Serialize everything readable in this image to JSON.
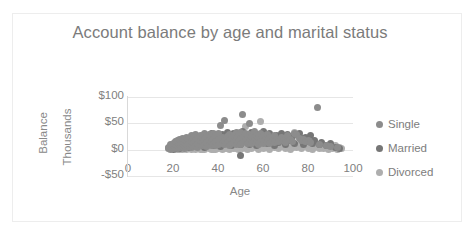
{
  "chart_data": {
    "type": "scatter",
    "title": "Account balance by age and marital status",
    "xlabel": "Age",
    "ylabel": "Balance",
    "y_unit_label": "Thousands",
    "xlim": [
      0,
      100
    ],
    "ylim": [
      -50,
      100
    ],
    "x_ticks": [
      "0",
      "20",
      "40",
      "60",
      "80",
      "100"
    ],
    "x_tick_values": [
      0,
      20,
      40,
      60,
      80,
      100
    ],
    "y_ticks": [
      "$100",
      "$50",
      "$0",
      "-$50"
    ],
    "y_tick_values": [
      100,
      50,
      0,
      -50
    ],
    "grid": true,
    "grid_axis": "y",
    "legend_position": "right",
    "marker_size_px": 7,
    "series": [
      {
        "name": "Single",
        "color": "#8c8c8c",
        "points": [
          [
            18,
            2
          ],
          [
            18,
            4
          ],
          [
            19,
            1
          ],
          [
            19,
            6
          ],
          [
            19,
            9
          ],
          [
            20,
            3
          ],
          [
            20,
            8
          ],
          [
            20,
            12
          ],
          [
            21,
            5
          ],
          [
            21,
            10
          ],
          [
            21,
            15
          ],
          [
            22,
            2
          ],
          [
            22,
            7
          ],
          [
            22,
            13
          ],
          [
            22,
            18
          ],
          [
            23,
            4
          ],
          [
            23,
            9
          ],
          [
            23,
            14
          ],
          [
            23,
            20
          ],
          [
            24,
            6
          ],
          [
            24,
            11
          ],
          [
            24,
            16
          ],
          [
            24,
            22
          ],
          [
            25,
            3
          ],
          [
            25,
            8
          ],
          [
            25,
            13
          ],
          [
            25,
            19
          ],
          [
            26,
            5
          ],
          [
            26,
            10
          ],
          [
            26,
            17
          ],
          [
            26,
            24
          ],
          [
            27,
            7
          ],
          [
            27,
            12
          ],
          [
            27,
            21
          ],
          [
            28,
            4
          ],
          [
            28,
            9
          ],
          [
            28,
            16
          ],
          [
            28,
            27
          ],
          [
            29,
            6
          ],
          [
            29,
            14
          ],
          [
            29,
            23
          ],
          [
            30,
            8
          ],
          [
            30,
            18
          ],
          [
            30,
            28
          ],
          [
            31,
            5
          ],
          [
            31,
            12
          ],
          [
            31,
            22
          ],
          [
            32,
            9
          ],
          [
            32,
            17
          ],
          [
            32,
            26
          ],
          [
            33,
            7
          ],
          [
            33,
            15
          ],
          [
            33,
            24
          ],
          [
            34,
            10
          ],
          [
            34,
            20
          ],
          [
            34,
            30
          ],
          [
            35,
            6
          ],
          [
            35,
            14
          ],
          [
            35,
            25
          ],
          [
            36,
            9
          ],
          [
            36,
            19
          ],
          [
            36,
            28
          ],
          [
            37,
            8
          ],
          [
            37,
            16
          ],
          [
            37,
            27
          ],
          [
            38,
            11
          ],
          [
            38,
            21
          ],
          [
            38,
            31
          ],
          [
            39,
            7
          ],
          [
            39,
            15
          ],
          [
            39,
            26
          ],
          [
            40,
            10
          ],
          [
            40,
            20
          ],
          [
            40,
            30
          ],
          [
            41,
            45
          ],
          [
            42,
            12
          ],
          [
            42,
            23
          ],
          [
            43,
            56
          ],
          [
            43,
            9
          ],
          [
            43,
            18
          ],
          [
            44,
            14
          ],
          [
            44,
            25
          ],
          [
            45,
            8
          ],
          [
            45,
            17
          ],
          [
            45,
            29
          ],
          [
            46,
            11
          ],
          [
            46,
            22
          ],
          [
            47,
            13
          ],
          [
            47,
            26
          ],
          [
            48,
            9
          ],
          [
            48,
            19
          ],
          [
            48,
            32
          ],
          [
            49,
            15
          ],
          [
            49,
            27
          ],
          [
            50,
            10
          ],
          [
            50,
            21
          ],
          [
            50,
            33
          ],
          [
            51,
            66
          ],
          [
            51,
            13
          ],
          [
            51,
            24
          ],
          [
            52,
            17
          ],
          [
            52,
            30
          ],
          [
            53,
            11
          ],
          [
            53,
            22
          ],
          [
            54,
            50
          ],
          [
            54,
            15
          ],
          [
            54,
            28
          ],
          [
            55,
            12
          ],
          [
            55,
            25
          ],
          [
            56,
            18
          ],
          [
            56,
            34
          ],
          [
            57,
            14
          ],
          [
            57,
            27
          ],
          [
            58,
            10
          ],
          [
            58,
            23
          ],
          [
            59,
            16
          ],
          [
            59,
            30
          ],
          [
            60,
            12
          ],
          [
            60,
            26
          ],
          [
            61,
            19
          ],
          [
            62,
            15
          ],
          [
            62,
            28
          ],
          [
            63,
            11
          ],
          [
            63,
            24
          ],
          [
            64,
            17
          ],
          [
            65,
            13
          ],
          [
            65,
            27
          ],
          [
            66,
            20
          ],
          [
            67,
            15
          ],
          [
            68,
            23
          ],
          [
            69,
            18
          ],
          [
            70,
            14
          ],
          [
            71,
            26
          ],
          [
            72,
            19
          ],
          [
            73,
            16
          ],
          [
            74,
            31
          ],
          [
            75,
            29
          ],
          [
            76,
            22
          ],
          [
            77,
            17
          ],
          [
            78,
            20
          ],
          [
            79,
            15
          ],
          [
            80,
            18
          ],
          [
            81,
            13
          ],
          [
            84,
            81
          ],
          [
            85,
            10
          ],
          [
            88,
            8
          ],
          [
            90,
            6
          ],
          [
            93,
            4
          ]
        ]
      },
      {
        "name": "Married",
        "color": "#767676",
        "points": [
          [
            20,
            1
          ],
          [
            21,
            3
          ],
          [
            22,
            5
          ],
          [
            23,
            2
          ],
          [
            24,
            8
          ],
          [
            25,
            6
          ],
          [
            26,
            12
          ],
          [
            27,
            4
          ],
          [
            28,
            14
          ],
          [
            29,
            9
          ],
          [
            30,
            19
          ],
          [
            31,
            7
          ],
          [
            32,
            21
          ],
          [
            33,
            13
          ],
          [
            34,
            5
          ],
          [
            35,
            23
          ],
          [
            36,
            11
          ],
          [
            37,
            30
          ],
          [
            38,
            8
          ],
          [
            39,
            24
          ],
          [
            40,
            16
          ],
          [
            41,
            6
          ],
          [
            42,
            29
          ],
          [
            43,
            12
          ],
          [
            44,
            33
          ],
          [
            45,
            20
          ],
          [
            46,
            7
          ],
          [
            47,
            31
          ],
          [
            48,
            14
          ],
          [
            49,
            25
          ],
          [
            50,
            9
          ],
          [
            50,
            -12
          ],
          [
            51,
            35
          ],
          [
            52,
            18
          ],
          [
            53,
            27
          ],
          [
            54,
            10
          ],
          [
            55,
            32
          ],
          [
            56,
            21
          ],
          [
            57,
            8
          ],
          [
            58,
            29
          ],
          [
            59,
            16
          ],
          [
            60,
            34
          ],
          [
            61,
            23
          ],
          [
            62,
            11
          ],
          [
            63,
            30
          ],
          [
            64,
            19
          ],
          [
            65,
            7
          ],
          [
            66,
            26
          ],
          [
            67,
            14
          ],
          [
            68,
            31
          ],
          [
            69,
            20
          ],
          [
            70,
            9
          ],
          [
            71,
            28
          ],
          [
            72,
            17
          ],
          [
            73,
            25
          ],
          [
            74,
            12
          ],
          [
            75,
            29
          ],
          [
            76,
            30
          ],
          [
            77,
            21
          ],
          [
            78,
            10
          ],
          [
            79,
            23
          ],
          [
            80,
            15
          ],
          [
            81,
            26
          ],
          [
            82,
            12
          ],
          [
            83,
            18
          ],
          [
            85,
            9
          ],
          [
            86,
            14
          ],
          [
            88,
            7
          ],
          [
            90,
            11
          ],
          [
            92,
            5
          ],
          [
            94,
            3
          ]
        ]
      },
      {
        "name": "Divorced",
        "color": "#aeaeae",
        "points": [
          [
            22,
            0
          ],
          [
            23,
            1
          ],
          [
            24,
            0
          ],
          [
            25,
            2
          ],
          [
            26,
            1
          ],
          [
            27,
            3
          ],
          [
            28,
            0
          ],
          [
            29,
            2
          ],
          [
            30,
            1
          ],
          [
            31,
            4
          ],
          [
            32,
            0
          ],
          [
            33,
            3
          ],
          [
            34,
            1
          ],
          [
            35,
            5
          ],
          [
            36,
            2
          ],
          [
            37,
            0
          ],
          [
            38,
            4
          ],
          [
            39,
            1
          ],
          [
            40,
            3
          ],
          [
            41,
            6
          ],
          [
            42,
            0
          ],
          [
            43,
            2
          ],
          [
            44,
            5
          ],
          [
            45,
            1
          ],
          [
            46,
            4
          ],
          [
            47,
            7
          ],
          [
            48,
            2
          ],
          [
            49,
            0
          ],
          [
            50,
            5
          ],
          [
            51,
            3
          ],
          [
            52,
            8
          ],
          [
            53,
            1
          ],
          [
            54,
            6
          ],
          [
            55,
            2
          ],
          [
            56,
            9
          ],
          [
            57,
            4
          ],
          [
            58,
            1
          ],
          [
            59,
            53
          ],
          [
            59,
            7
          ],
          [
            60,
            3
          ],
          [
            61,
            10
          ],
          [
            62,
            5
          ],
          [
            63,
            1
          ],
          [
            64,
            8
          ],
          [
            65,
            4
          ],
          [
            66,
            12
          ],
          [
            67,
            2
          ],
          [
            68,
            6
          ],
          [
            69,
            9
          ],
          [
            70,
            3
          ],
          [
            71,
            7
          ],
          [
            72,
            1
          ],
          [
            73,
            5
          ],
          [
            74,
            32
          ],
          [
            74,
            10
          ],
          [
            75,
            4
          ],
          [
            76,
            8
          ],
          [
            77,
            2
          ],
          [
            78,
            6
          ],
          [
            79,
            11
          ],
          [
            80,
            3
          ],
          [
            81,
            7
          ],
          [
            82,
            1
          ],
          [
            83,
            5
          ],
          [
            84,
            9
          ],
          [
            85,
            2
          ],
          [
            86,
            6
          ],
          [
            87,
            3
          ],
          [
            88,
            8
          ],
          [
            89,
            1
          ],
          [
            90,
            5
          ],
          [
            91,
            2
          ],
          [
            92,
            7
          ],
          [
            93,
            1
          ],
          [
            94,
            4
          ],
          [
            95,
            2
          ],
          [
            52,
            44
          ],
          [
            47,
            3
          ],
          [
            44,
            2
          ],
          [
            38,
            1
          ],
          [
            33,
            0
          ]
        ]
      }
    ]
  },
  "legend": {
    "items": [
      {
        "label": "Single",
        "color": "#8c8c8c"
      },
      {
        "label": "Married",
        "color": "#767676"
      },
      {
        "label": "Divorced",
        "color": "#aeaeae"
      }
    ]
  }
}
